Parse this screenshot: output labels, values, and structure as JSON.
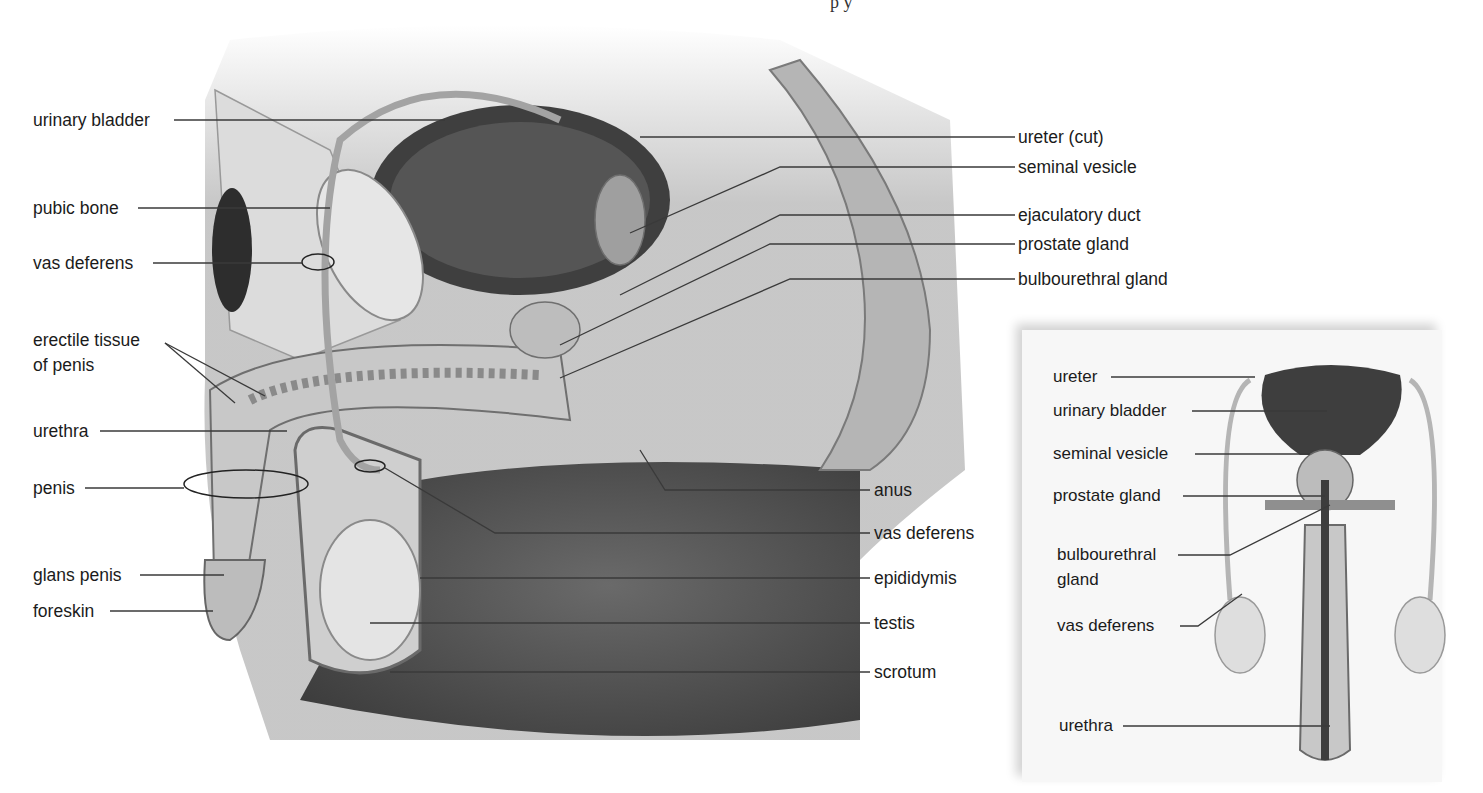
{
  "header": {
    "fragment": "p y"
  },
  "colors": {
    "background": "#ffffff",
    "label_text": "#1b1b1b",
    "leader_line": "#3a3a3a",
    "body_dark": "#4a4a4a",
    "body_mid": "#8c8c8c",
    "body_light": "#d4d4d4",
    "inset_background": "#f7f7f7"
  },
  "main_view": {
    "title": "Sagittal section (side view)",
    "labels_left": [
      {
        "text": "urinary bladder",
        "x": 33,
        "y": 110
      },
      {
        "text": "pubic bone",
        "x": 33,
        "y": 198
      },
      {
        "text": "vas deferens",
        "x": 33,
        "y": 253
      },
      {
        "text": "erectile tissue",
        "x": 33,
        "y": 330
      },
      {
        "text": "of penis",
        "x": 33,
        "y": 355
      },
      {
        "text": "urethra",
        "x": 33,
        "y": 421
      },
      {
        "text": "penis",
        "x": 33,
        "y": 478
      },
      {
        "text": "glans penis",
        "x": 33,
        "y": 565
      },
      {
        "text": "foreskin",
        "x": 33,
        "y": 601
      }
    ],
    "labels_right": [
      {
        "text": "ureter (cut)",
        "x": 1018,
        "y": 127
      },
      {
        "text": "seminal vesicle",
        "x": 1018,
        "y": 157
      },
      {
        "text": "ejaculatory duct",
        "x": 1018,
        "y": 205
      },
      {
        "text": "prostate gland",
        "x": 1018,
        "y": 234
      },
      {
        "text": "bulbourethral gland",
        "x": 1018,
        "y": 269
      },
      {
        "text": "anus",
        "x": 874,
        "y": 480
      },
      {
        "text": "vas deferens",
        "x": 874,
        "y": 523
      },
      {
        "text": "epididymis",
        "x": 874,
        "y": 568
      },
      {
        "text": "testis",
        "x": 874,
        "y": 613
      },
      {
        "text": "scrotum",
        "x": 874,
        "y": 662
      }
    ]
  },
  "inset_view": {
    "title": "Frontal view",
    "labels": [
      {
        "text": "ureter",
        "x": 1053,
        "y": 367
      },
      {
        "text": "urinary bladder",
        "x": 1053,
        "y": 401
      },
      {
        "text": "seminal vesicle",
        "x": 1053,
        "y": 444
      },
      {
        "text": "prostate gland",
        "x": 1053,
        "y": 486
      },
      {
        "text": "bulbourethral",
        "x": 1057,
        "y": 545
      },
      {
        "text": "gland",
        "x": 1057,
        "y": 570
      },
      {
        "text": "vas deferens",
        "x": 1057,
        "y": 616
      },
      {
        "text": "urethra",
        "x": 1059,
        "y": 716
      }
    ]
  }
}
